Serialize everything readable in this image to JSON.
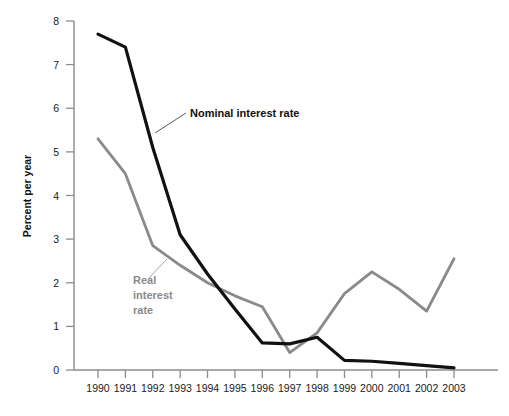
{
  "chart_data": {
    "type": "line",
    "title": "",
    "subtitle": "",
    "xlabel": "",
    "ylabel": "Percent per year",
    "categories": [
      "1990",
      "1991",
      "1992",
      "1993",
      "1994",
      "1995",
      "1996",
      "1997",
      "1998",
      "1999",
      "2000",
      "2001",
      "2002",
      "2003"
    ],
    "x": [
      1990,
      1991,
      1992,
      1993,
      1994,
      1995,
      1996,
      1997,
      1998,
      1999,
      2000,
      2001,
      2002,
      2003
    ],
    "xlim": [
      1990,
      2003
    ],
    "ylim": [
      0,
      8
    ],
    "yticks": [
      0,
      1,
      2,
      3,
      4,
      5,
      6,
      7,
      8
    ],
    "ytick_labels": [
      "0",
      "1",
      "2",
      "3",
      "4",
      "5",
      "6",
      "7",
      "8"
    ],
    "xtick_labels": [
      "1990",
      "1991",
      "1992",
      "1993",
      "1994",
      "1995",
      "1996",
      "1997",
      "1998",
      "1999",
      "2000",
      "2001",
      "2002",
      "2003"
    ],
    "grid": false,
    "legend_position": "inline-annotations",
    "series": [
      {
        "name": "Nominal interest rate",
        "color": "#111111",
        "values": [
          7.7,
          7.4,
          5.1,
          3.1,
          2.2,
          1.4,
          0.62,
          0.6,
          0.75,
          0.22,
          0.2,
          0.15,
          0.1,
          0.05
        ]
      },
      {
        "name": "Real interest rate",
        "color": "#8a8a8a",
        "values": [
          5.3,
          4.5,
          2.85,
          2.4,
          2.0,
          1.7,
          1.45,
          0.4,
          0.85,
          1.75,
          2.25,
          1.85,
          1.35,
          2.55
        ]
      }
    ],
    "annotations": [
      {
        "text": "Nominal interest rate",
        "series": "Nominal interest rate",
        "color": "#111111"
      },
      {
        "text": "Real",
        "series": "Real interest rate",
        "color": "#8a8a8a"
      },
      {
        "text": "interest",
        "series": "Real interest rate",
        "color": "#8a8a8a"
      },
      {
        "text": "rate",
        "series": "Real interest rate",
        "color": "#8a8a8a"
      }
    ]
  },
  "axes": {
    "y_title": "Percent per year",
    "y_ticks": [
      "8",
      "7",
      "6",
      "5",
      "4",
      "3",
      "2",
      "1",
      "0"
    ],
    "x_ticks": [
      "1990",
      "1991",
      "1992",
      "1993",
      "1994",
      "1995",
      "1996",
      "1997",
      "1998",
      "1999",
      "2000",
      "2001",
      "2002",
      "2003"
    ]
  },
  "labels": {
    "nominal": "Nominal interest rate",
    "real_line1": "Real",
    "real_line2": "interest",
    "real_line3": "rate"
  },
  "colors": {
    "nominal": "#111111",
    "real": "#8a8a8a",
    "axis": "#8c8c8c",
    "text": "#1a1a1a",
    "background": "#ffffff"
  }
}
